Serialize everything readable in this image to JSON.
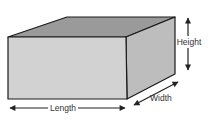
{
  "diagram": {
    "labels": {
      "length": "Length",
      "width": "Width",
      "height": "Height"
    },
    "colors": {
      "front_face": "#d2d2d2",
      "top_face": "#9a9a9a",
      "side_face": "#bdbdbd",
      "edges": "#1a1a1a",
      "arrows": "#222222"
    }
  }
}
